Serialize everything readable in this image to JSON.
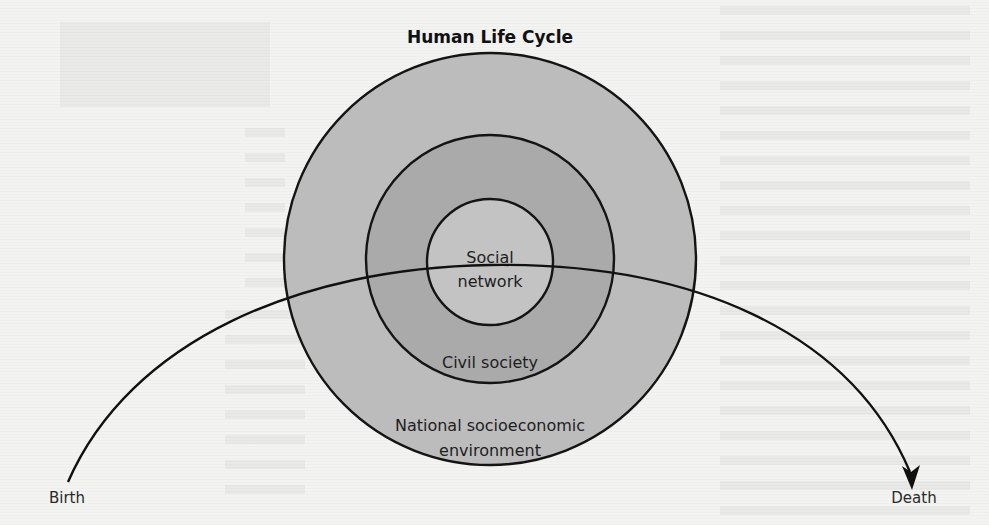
{
  "diagram": {
    "title": "Human Life Cycle",
    "rings": [
      {
        "id": "outer",
        "label_line1": "National socioeconomic",
        "label_line2": "environment",
        "fill": "#bcbcbc"
      },
      {
        "id": "middle",
        "label": "Civil society",
        "fill": "#aaaaaa"
      },
      {
        "id": "inner",
        "label_line1": "Social",
        "label_line2": "network",
        "fill": "#c3c3c3"
      }
    ],
    "life_arc": {
      "start_label": "Birth",
      "end_label": "Death",
      "stroke": "#111111"
    }
  }
}
